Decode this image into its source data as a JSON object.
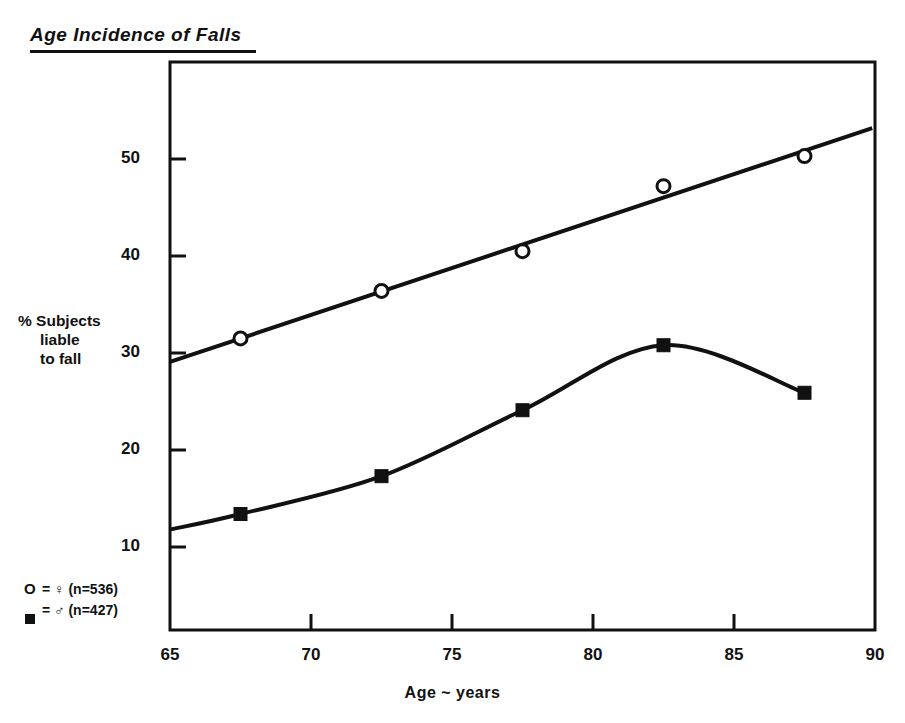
{
  "chart_data": {
    "type": "line",
    "title": "Age Incidence of Falls",
    "xlabel": "Age ~ years",
    "ylabel": "% Subjects liable to fall",
    "ylabel_lines": [
      "% Subjects",
      "liable",
      "to fall"
    ],
    "xlim": [
      65,
      90
    ],
    "ylim": [
      5,
      57
    ],
    "xticks": [
      65,
      70,
      75,
      80,
      85,
      90
    ],
    "xtick_labels": [
      "65",
      "70",
      "75",
      "80",
      "85",
      "90"
    ],
    "yticks": [
      10,
      20,
      30,
      40,
      50
    ],
    "ytick_labels": [
      "10",
      "20",
      "30",
      "40",
      "50"
    ],
    "grid": false,
    "legend_position": "bottom-left",
    "x": [
      67.5,
      72.5,
      77.5,
      82.5,
      87.5
    ],
    "series": [
      {
        "name": "O = ♀ (n=536)",
        "marker": "open-circle",
        "n": 536,
        "sex": "female",
        "values": [
          31.5,
          36.4,
          40.5,
          47.2,
          50.3
        ]
      },
      {
        "name": "■ = ♂ (n=427)",
        "marker": "filled-square",
        "n": 427,
        "sex": "male",
        "values": [
          13.4,
          17.3,
          24.1,
          30.8,
          25.9
        ]
      }
    ],
    "legend": [
      {
        "symbol": "O",
        "equals": "=",
        "sex_glyph": "♀",
        "label": "(n=536)",
        "text": "O = ♀ (n=536)"
      },
      {
        "symbol": "■",
        "equals": "=",
        "sex_glyph": "♂",
        "label": "(n=427)",
        "text": "■ = ♂ (n=427)"
      }
    ],
    "colors": {
      "ink": "#111111",
      "background": "#ffffff"
    }
  },
  "figure": {
    "title": "Age Incidence of Falls",
    "xlabel": "Age ~ years",
    "ylabel_lines": {
      "line1": "% Subjects",
      "line2": "liable",
      "line3": "to fall"
    },
    "legend_row1": "O = ♀ (n=536)",
    "legend_row2_symbol": "",
    "legend_row2": "= ♂ (n=427)",
    "legend_row1_symbol": "O",
    "legend_row1_text": "= ♀ (n=536)",
    "xticks": {
      "t0": "65",
      "t1": "70",
      "t2": "75",
      "t3": "80",
      "t4": "85",
      "t5": "90"
    },
    "yticks": {
      "t0": "10",
      "t1": "20",
      "t2": "30",
      "t3": "40",
      "t4": "50"
    }
  }
}
